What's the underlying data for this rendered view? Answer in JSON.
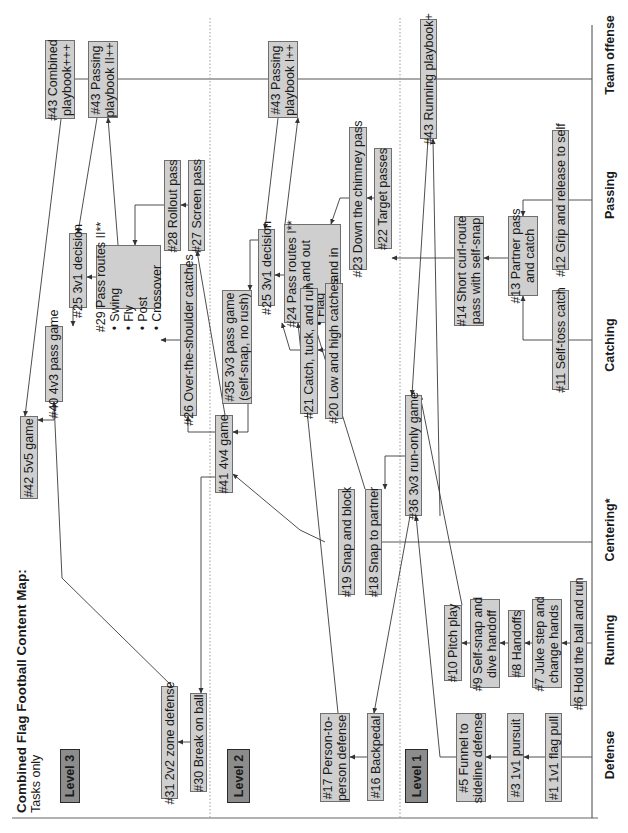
{
  "title": {
    "main": "Combined Flag Football Content Map:",
    "sub": "Tasks only"
  },
  "categories": [
    {
      "id": "defense",
      "label": "Defense",
      "y": 755
    },
    {
      "id": "running",
      "label": "Running",
      "y": 640
    },
    {
      "id": "centering",
      "label": "Centering*",
      "y": 530
    },
    {
      "id": "catching",
      "label": "Catching",
      "y": 345
    },
    {
      "id": "passing",
      "label": "Passing",
      "y": 195
    },
    {
      "id": "team-offense",
      "label": "Team offense",
      "y": 55
    }
  ],
  "levels": [
    {
      "id": "level-3",
      "label": "Level 3",
      "x": 60,
      "y": 749,
      "w": 20,
      "h": 54
    },
    {
      "id": "level-2",
      "label": "Level 2",
      "x": 227,
      "y": 749,
      "w": 23,
      "h": 54
    },
    {
      "id": "level-1",
      "label": "Level 1",
      "x": 405,
      "y": 749,
      "w": 23,
      "h": 54
    }
  ],
  "boxes": [
    {
      "id": "t43-combined",
      "lines": [
        "#43 Combined",
        "playbook+++"
      ],
      "x": 45,
      "y": 40,
      "w": 30,
      "h": 79
    },
    {
      "id": "t43-passing-2",
      "lines": [
        "#43 Passing",
        "playbook II++"
      ],
      "x": 88,
      "y": 41,
      "w": 30,
      "h": 77
    },
    {
      "id": "t29-pass-routes-2",
      "lines": [
        "#29 Pass routes II**"
      ],
      "bullets": [
        "Swing",
        "Fly",
        "Post",
        "Crossover"
      ],
      "x": 96,
      "y": 245,
      "w": 65,
      "h": 64
    },
    {
      "id": "t25-3v1-decision-l3",
      "lines": [
        "#25 3v1 decision"
      ],
      "x": 69,
      "y": 233,
      "w": 18,
      "h": 75
    },
    {
      "id": "t40-4v3-pass-game",
      "lines": [
        "#40 4v3 pass game"
      ],
      "x": 45,
      "y": 326,
      "w": 18,
      "h": 76
    },
    {
      "id": "t42-5v5-game",
      "lines": [
        "#42 5v5 game"
      ],
      "x": 20,
      "y": 416,
      "w": 18,
      "h": 83
    },
    {
      "id": "t28-rollout-pass",
      "lines": [
        "#28 Rollout pass"
      ],
      "x": 164,
      "y": 160,
      "w": 17,
      "h": 91
    },
    {
      "id": "t27-screen-pass",
      "lines": [
        "#27 Screen pass"
      ],
      "x": 188,
      "y": 160,
      "w": 17,
      "h": 91
    },
    {
      "id": "t26-over-the-shoulder",
      "lines": [
        "#26 Over-the-shoulder catches"
      ],
      "x": 180,
      "y": 264,
      "w": 17,
      "h": 152
    },
    {
      "id": "t31-2v2-zone-defense",
      "lines": [
        "#31 2v2 zone defense"
      ],
      "x": 161,
      "y": 686,
      "w": 17,
      "h": 113
    },
    {
      "id": "t30-break-on-ball",
      "lines": [
        "#30 Break on ball"
      ],
      "x": 190,
      "y": 693,
      "w": 17,
      "h": 99
    },
    {
      "id": "t43-passing-1",
      "lines": [
        "#43 Passing",
        "playbook I++"
      ],
      "x": 268,
      "y": 41,
      "w": 30,
      "h": 77
    },
    {
      "id": "t25-3v1-decision-l2",
      "lines": [
        "#25 3v1 decision"
      ],
      "x": 258,
      "y": 229,
      "w": 17,
      "h": 77
    },
    {
      "id": "t24-pass-routes-1",
      "lines": [
        "#24 Pass routes I**"
      ],
      "bullets": [
        "Down and out",
        "Flag",
        "Down and in"
      ],
      "x": 284,
      "y": 224,
      "w": 57,
      "h": 99
    },
    {
      "id": "t35-3v3-pass-game",
      "lines": [
        "#35 3v3 pass game",
        "(self-snap, no rush)"
      ],
      "x": 222,
      "y": 290,
      "w": 30,
      "h": 114
    },
    {
      "id": "t41-4v4-game",
      "lines": [
        "#41 4v4 game"
      ],
      "x": 215,
      "y": 415,
      "w": 18,
      "h": 78
    },
    {
      "id": "t23-down-the-chimney",
      "lines": [
        "#23 Down the chimney pass"
      ],
      "x": 349,
      "y": 127,
      "w": 18,
      "h": 143
    },
    {
      "id": "t22-target-passes",
      "lines": [
        "#22 Target passes"
      ],
      "x": 374,
      "y": 148,
      "w": 18,
      "h": 101
    },
    {
      "id": "t21-catch-tuck-run",
      "lines": [
        "#21 Catch, tuck, and run"
      ],
      "x": 300,
      "y": 288,
      "w": 18,
      "h": 126
    },
    {
      "id": "t20-low-high-catches",
      "lines": [
        "#20 Low and high catches"
      ],
      "x": 325,
      "y": 283,
      "w": 18,
      "h": 136
    },
    {
      "id": "t19-snap-and-block",
      "lines": [
        "#19 Snap and block"
      ],
      "x": 338,
      "y": 489,
      "w": 17,
      "h": 106
    },
    {
      "id": "t18-snap-to-partner",
      "lines": [
        "#18 Snap to partner"
      ],
      "x": 365,
      "y": 489,
      "w": 17,
      "h": 106
    },
    {
      "id": "t36-3v3-run-only",
      "lines": [
        "#36 3v3 run-only game"
      ],
      "x": 405,
      "y": 395,
      "w": 17,
      "h": 121
    },
    {
      "id": "t17-person-to-person",
      "lines": [
        "#17 Person-to-",
        "person defense"
      ],
      "x": 320,
      "y": 713,
      "w": 30,
      "h": 89
    },
    {
      "id": "t16-backpedal",
      "lines": [
        "#16 Backpedal"
      ],
      "x": 367,
      "y": 713,
      "w": 17,
      "h": 88
    },
    {
      "id": "t43-running-playbook",
      "lines": [
        "#43 Running playbook+"
      ],
      "x": 420,
      "y": 19,
      "w": 17,
      "h": 120
    },
    {
      "id": "t14-short-curl-route",
      "lines": [
        "#14 Short curl-route",
        "pass with self-snap"
      ],
      "x": 454,
      "y": 216,
      "w": 30,
      "h": 110
    },
    {
      "id": "t13-partner-pass",
      "lines": [
        "#13 Partner pass",
        "and catch"
      ],
      "x": 508,
      "y": 216,
      "w": 30,
      "h": 80
    },
    {
      "id": "t12-grip-and-release",
      "lines": [
        "#12 Grip and release to self"
      ],
      "x": 552,
      "y": 130,
      "w": 17,
      "h": 140
    },
    {
      "id": "t11-self-toss-catch",
      "lines": [
        "#11 Self-toss catch"
      ],
      "x": 552,
      "y": 290,
      "w": 17,
      "h": 100
    },
    {
      "id": "t10-pitch-play",
      "lines": [
        "#10 Pitch play"
      ],
      "x": 444,
      "y": 605,
      "w": 18,
      "h": 76
    },
    {
      "id": "t9-self-snap-dive",
      "lines": [
        "#9 Self-snap and",
        "dive handoff"
      ],
      "x": 470,
      "y": 599,
      "w": 30,
      "h": 89
    },
    {
      "id": "t8-handoffs",
      "lines": [
        "#8 Handoffs"
      ],
      "x": 508,
      "y": 610,
      "w": 17,
      "h": 67
    },
    {
      "id": "t7-juke-step",
      "lines": [
        "#7 Juke step and",
        "change hands"
      ],
      "x": 532,
      "y": 599,
      "w": 30,
      "h": 89
    },
    {
      "id": "t6-hold-ball-run",
      "lines": [
        "#6 Hold the ball and run"
      ],
      "x": 570,
      "y": 581,
      "w": 17,
      "h": 125
    },
    {
      "id": "t5-funnel-sideline",
      "lines": [
        "#5 Funnel to",
        "sideline defense"
      ],
      "x": 456,
      "y": 713,
      "w": 30,
      "h": 89
    },
    {
      "id": "t3-1v1-pursuit",
      "lines": [
        "#3 1v1 pursuit"
      ],
      "x": 507,
      "y": 713,
      "w": 17,
      "h": 89
    },
    {
      "id": "t1-1v1-flag-pull",
      "lines": [
        "#1 1v1 flag pull"
      ],
      "x": 545,
      "y": 713,
      "w": 17,
      "h": 89
    }
  ],
  "lines": [
    {
      "points": [
        [
          12,
          818
        ],
        [
          598,
          818
        ]
      ],
      "color": "#666666",
      "w": 1.2
    },
    {
      "points": [
        [
          592,
          25
        ],
        [
          592,
          818
        ]
      ],
      "color": "#444444",
      "w": 1
    },
    {
      "points": [
        [
          75,
          79
        ],
        [
          88,
          79
        ]
      ],
      "color": "#555555",
      "w": 1
    },
    {
      "points": [
        [
          118,
          79
        ],
        [
          268,
          79
        ]
      ],
      "color": "#555555",
      "w": 1
    },
    {
      "points": [
        [
          298,
          79
        ],
        [
          420,
          79
        ]
      ],
      "color": "#555555",
      "w": 1
    },
    {
      "points": [
        [
          437,
          79
        ],
        [
          592,
          79
        ]
      ],
      "color": "#555555",
      "w": 1
    },
    {
      "points": [
        [
          569,
          200
        ],
        [
          592,
          200
        ]
      ],
      "color": "#555555",
      "w": 1
    },
    {
      "points": [
        [
          569,
          340
        ],
        [
          592,
          340
        ]
      ],
      "color": "#555555",
      "w": 1
    },
    {
      "points": [
        [
          382,
          542
        ],
        [
          592,
          542
        ]
      ],
      "color": "#555555",
      "w": 1
    },
    {
      "points": [
        [
          587,
          643
        ],
        [
          592,
          643
        ]
      ],
      "color": "#555555",
      "w": 1
    },
    {
      "points": [
        [
          562,
          757
        ],
        [
          592,
          757
        ]
      ],
      "color": "#555555",
      "w": 1
    }
  ],
  "dotted": [
    {
      "points": [
        [
          210,
          18
        ],
        [
          210,
          818
        ]
      ]
    },
    {
      "points": [
        [
          400,
          18
        ],
        [
          400,
          818
        ]
      ]
    }
  ],
  "arrows": [
    {
      "points": [
        [
          61,
          119
        ],
        [
          25,
          416
        ]
      ]
    },
    {
      "points": [
        [
          97,
          118
        ],
        [
          78,
          233
        ]
      ]
    },
    {
      "points": [
        [
          118,
          245
        ],
        [
          108,
          118
        ]
      ]
    },
    {
      "points": [
        [
          96,
          277
        ],
        [
          87,
          277
        ]
      ]
    },
    {
      "points": [
        [
          73,
          308
        ],
        [
          73,
          326
        ]
      ]
    },
    {
      "points": [
        [
          54,
          402
        ],
        [
          54,
          420
        ],
        [
          38,
          420
        ]
      ]
    },
    {
      "points": [
        [
          164,
          205
        ],
        [
          135,
          205
        ],
        [
          135,
          245
        ]
      ]
    },
    {
      "points": [
        [
          188,
          205
        ],
        [
          181,
          205
        ]
      ]
    },
    {
      "points": [
        [
          180,
          340
        ],
        [
          161,
          340
        ]
      ]
    },
    {
      "points": [
        [
          215,
          432
        ],
        [
          188,
          432
        ],
        [
          188,
          416
        ]
      ]
    },
    {
      "points": [
        [
          225,
          415
        ],
        [
          197,
          251
        ]
      ]
    },
    {
      "points": [
        [
          248,
          404
        ],
        [
          248,
          432
        ],
        [
          233,
          432
        ]
      ]
    },
    {
      "points": [
        [
          218,
          477
        ],
        [
          201,
          477
        ],
        [
          201,
          693
        ]
      ]
    },
    {
      "points": [
        [
          176,
          690
        ],
        [
          62,
          578
        ],
        [
          54,
          402
        ]
      ]
    },
    {
      "points": [
        [
          190,
          742
        ],
        [
          178,
          742
        ]
      ]
    },
    {
      "points": [
        [
          278,
          118
        ],
        [
          265,
          229
        ]
      ]
    },
    {
      "points": [
        [
          285,
          224
        ],
        [
          298,
          118
        ]
      ]
    },
    {
      "points": [
        [
          270,
          229
        ],
        [
          270,
          240
        ],
        [
          250,
          240
        ],
        [
          250,
          290
        ]
      ]
    },
    {
      "points": [
        [
          284,
          275
        ],
        [
          275,
          275
        ]
      ]
    },
    {
      "points": [
        [
          300,
          350
        ],
        [
          290,
          350
        ],
        [
          282,
          323
        ]
      ]
    },
    {
      "points": [
        [
          325,
          350
        ],
        [
          318,
          350
        ]
      ]
    },
    {
      "points": [
        [
          349,
          198
        ],
        [
          340,
          198
        ],
        [
          331,
          224
        ]
      ]
    },
    {
      "points": [
        [
          374,
          198
        ],
        [
          367,
          198
        ]
      ]
    },
    {
      "points": [
        [
          454,
          258
        ],
        [
          401,
          258
        ],
        [
          392,
          258
        ]
      ]
    },
    {
      "points": [
        [
          352,
          542
        ],
        [
          355,
          542
        ]
      ]
    },
    {
      "points": [
        [
          325,
          542
        ],
        [
          300,
          530
        ],
        [
          233,
          474
        ]
      ]
    },
    {
      "points": [
        [
          365,
          489
        ],
        [
          314,
          323
        ]
      ]
    },
    {
      "points": [
        [
          405,
          456
        ],
        [
          385,
          456
        ],
        [
          385,
          489
        ]
      ]
    },
    {
      "points": [
        [
          410,
          516
        ],
        [
          374,
          713
        ]
      ]
    },
    {
      "points": [
        [
          338,
          713
        ],
        [
          298,
          323
        ]
      ]
    },
    {
      "points": [
        [
          428,
          139
        ],
        [
          412,
          395
        ]
      ]
    },
    {
      "points": [
        [
          440,
          516
        ],
        [
          433,
          139
        ]
      ]
    },
    {
      "points": [
        [
          462,
          605
        ],
        [
          420,
          395
        ]
      ]
    },
    {
      "points": [
        [
          367,
          757
        ],
        [
          350,
          757
        ]
      ]
    },
    {
      "points": [
        [
          456,
          757
        ],
        [
          440,
          757
        ],
        [
          416,
          516
        ]
      ]
    },
    {
      "points": [
        [
          508,
          258
        ],
        [
          484,
          258
        ]
      ]
    },
    {
      "points": [
        [
          552,
          200
        ],
        [
          523,
          200
        ],
        [
          523,
          216
        ]
      ]
    },
    {
      "points": [
        [
          552,
          340
        ],
        [
          523,
          340
        ],
        [
          523,
          296
        ]
      ]
    },
    {
      "points": [
        [
          470,
          643
        ],
        [
          462,
          643
        ]
      ]
    },
    {
      "points": [
        [
          508,
          643
        ],
        [
          500,
          643
        ]
      ]
    },
    {
      "points": [
        [
          532,
          643
        ],
        [
          525,
          643
        ]
      ]
    },
    {
      "points": [
        [
          570,
          643
        ],
        [
          562,
          643
        ]
      ]
    },
    {
      "points": [
        [
          507,
          757
        ],
        [
          486,
          757
        ]
      ]
    },
    {
      "points": [
        [
          545,
          757
        ],
        [
          524,
          757
        ]
      ]
    },
    {
      "points": [
        [
          562,
          757
        ],
        [
          562,
          757
        ]
      ]
    }
  ]
}
